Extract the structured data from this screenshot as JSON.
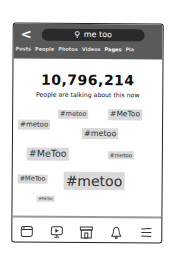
{
  "header": {
    "back_label": "<",
    "search_icon": "🔍",
    "search_query": "me too",
    "tabs": [
      {
        "label": "Posts"
      },
      {
        "label": "People"
      },
      {
        "label": "Photos"
      },
      {
        "label": "Videos"
      },
      {
        "label": "Pages",
        "active": true
      },
      {
        "label": "Pla"
      }
    ]
  },
  "main": {
    "count": "10,796,214",
    "subtitle": "People are talking about this now",
    "tags": [
      {
        "text": "#metoo",
        "size": 6.5,
        "x": 45,
        "y": 86
      },
      {
        "text": "#MeToo",
        "size": 7.5,
        "x": 95,
        "y": 85
      },
      {
        "text": "#metoo",
        "size": 7,
        "x": 5,
        "y": 96
      },
      {
        "text": "#metoo",
        "size": 8,
        "x": 69,
        "y": 104
      },
      {
        "text": "#MeToo",
        "size": 9.5,
        "x": 14,
        "y": 124
      },
      {
        "text": "#metoo",
        "size": 5.5,
        "x": 95,
        "y": 127
      },
      {
        "text": "#MeToo",
        "size": 6.5,
        "x": 5,
        "y": 151
      },
      {
        "text": "#metoo",
        "size": 14,
        "x": 51,
        "y": 148
      },
      {
        "text": "#MeToo",
        "size": 3.5,
        "x": 24,
        "y": 172
      }
    ]
  },
  "bottom_nav": {
    "items": [
      {
        "icon": "news-feed-icon"
      },
      {
        "icon": "video-icon"
      },
      {
        "icon": "marketplace-icon"
      },
      {
        "icon": "bell-icon"
      },
      {
        "icon": "menu-icon"
      }
    ]
  }
}
